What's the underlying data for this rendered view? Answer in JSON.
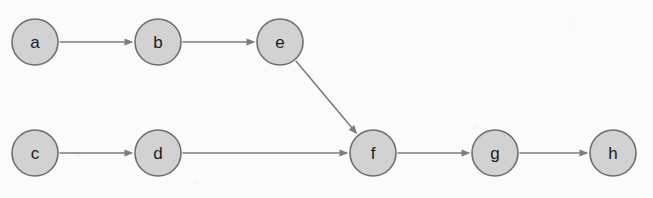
{
  "diagram": {
    "type": "directed-graph",
    "title": "",
    "canvas": {
      "width": 653,
      "height": 198
    },
    "style": {
      "background_color": "#fbfbfb",
      "node_fill": "#d2d2d2",
      "node_stroke": "#6f6f6f",
      "node_radius": 23,
      "edge_color": "#7d7d7d",
      "label_color": "#1c1c1c"
    },
    "nodes": [
      {
        "id": "a",
        "label": "a",
        "cx": 35,
        "cy": 42,
        "r": 23
      },
      {
        "id": "b",
        "label": "b",
        "cx": 158,
        "cy": 42,
        "r": 23
      },
      {
        "id": "e",
        "label": "e",
        "cx": 280,
        "cy": 42,
        "r": 23
      },
      {
        "id": "c",
        "label": "c",
        "cx": 35,
        "cy": 153,
        "r": 23
      },
      {
        "id": "d",
        "label": "d",
        "cx": 158,
        "cy": 153,
        "r": 23
      },
      {
        "id": "f",
        "label": "f",
        "cx": 373,
        "cy": 153,
        "r": 23
      },
      {
        "id": "g",
        "label": "g",
        "cx": 495,
        "cy": 153,
        "r": 23
      },
      {
        "id": "h",
        "label": "h",
        "cx": 613,
        "cy": 153,
        "r": 23
      }
    ],
    "edges": [
      {
        "id": "a-b",
        "from": "a",
        "to": "b",
        "directed": true,
        "style": "solid"
      },
      {
        "id": "b-e",
        "from": "b",
        "to": "e",
        "directed": true,
        "style": "solid"
      },
      {
        "id": "e-f",
        "from": "e",
        "to": "f",
        "directed": true,
        "style": "solid"
      },
      {
        "id": "c-d",
        "from": "c",
        "to": "d",
        "directed": true,
        "style": "solid"
      },
      {
        "id": "d-f",
        "from": "d",
        "to": "f",
        "directed": true,
        "style": "solid"
      },
      {
        "id": "f-g",
        "from": "f",
        "to": "g",
        "directed": true,
        "style": "solid"
      },
      {
        "id": "g-h",
        "from": "g",
        "to": "h",
        "directed": true,
        "style": "solid"
      }
    ]
  }
}
